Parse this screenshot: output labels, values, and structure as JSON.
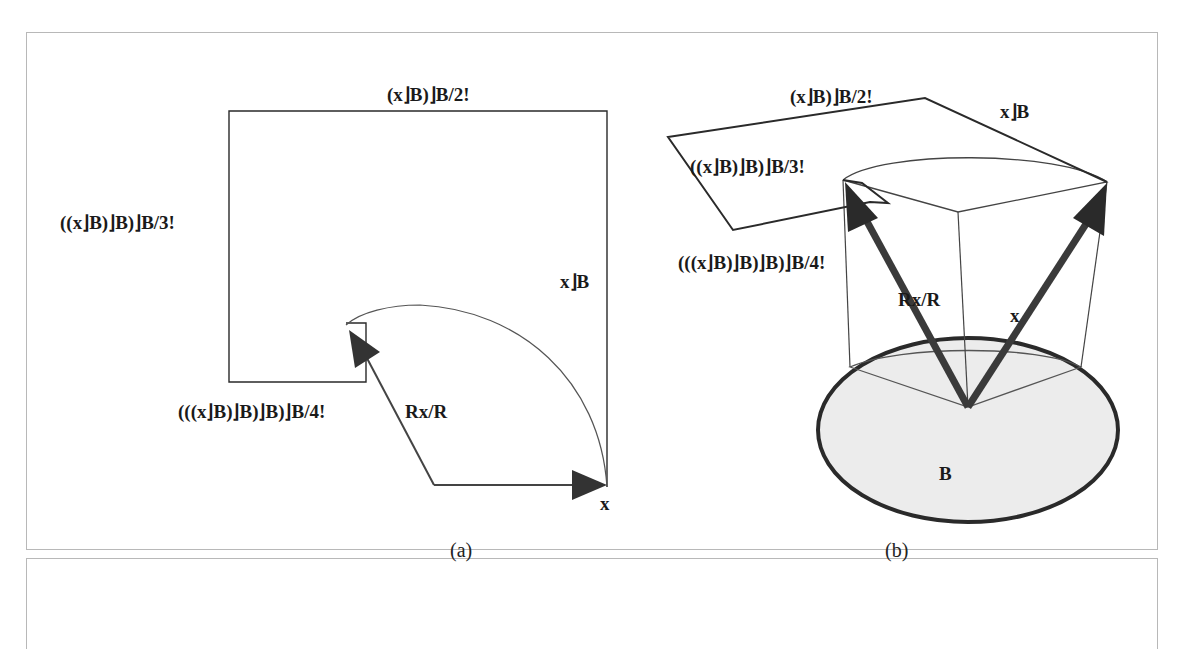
{
  "figure": {
    "panel_a": {
      "caption": "(a)",
      "labels": {
        "top": "(x⌋B)⌋B/2!",
        "left": "((x⌋B)⌋B)⌋B/3!",
        "right": "x⌋B",
        "bottom_left": "(((x⌋B)⌋B)⌋B)⌋B/4!",
        "rotated_vector": "Rx/R",
        "vector": "x"
      }
    },
    "panel_b": {
      "caption": "(b)",
      "labels": {
        "top": "(x⌋B)⌋B/2!",
        "top_right": "x⌋B",
        "left": "((x⌋B)⌋B)⌋B/3!",
        "bottom_left": "(((x⌋B)⌋B)⌋B)⌋B/4!",
        "rotated_vector": "Rx/R",
        "vector": "x",
        "plane": "B"
      }
    },
    "colors": {
      "line": "#2a2a2a",
      "arrow": "#3a3a3a",
      "disk_fill": "#ececec",
      "frame": "#b8b8b8"
    }
  }
}
